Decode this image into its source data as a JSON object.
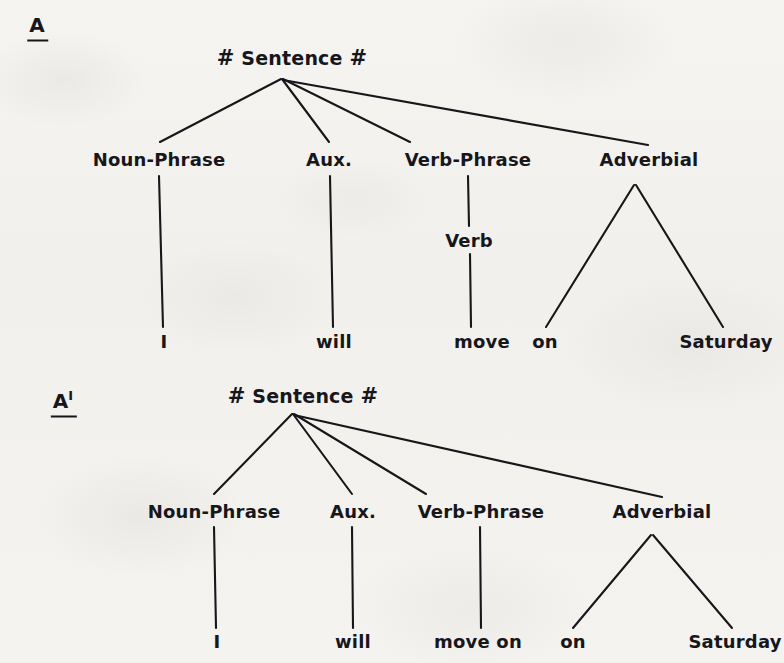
{
  "figure": {
    "kind": "phrase-structure-tree-pair",
    "background_color": "#f3f2ef",
    "ink_color": "#17171b"
  },
  "trees": [
    {
      "id": "A",
      "tag": "A",
      "tag_prime": "",
      "root": {
        "hash_left": "#",
        "text": "Sentence",
        "hash_right": "#"
      },
      "constituents": [
        {
          "label": "Noun-Phrase"
        },
        {
          "label": "Aux."
        },
        {
          "label": "Verb-Phrase"
        },
        {
          "label": "Adverbial"
        }
      ],
      "intermediate": [
        {
          "label": "Verb"
        }
      ],
      "terminals": [
        {
          "word": "I"
        },
        {
          "word": "will"
        },
        {
          "word": "move"
        },
        {
          "word": "on"
        },
        {
          "word": "Saturday"
        }
      ]
    },
    {
      "id": "A-prime",
      "tag": "A",
      "tag_prime": "I",
      "root": {
        "hash_left": "#",
        "text": "Sentence",
        "hash_right": "#"
      },
      "constituents": [
        {
          "label": "Noun-Phrase"
        },
        {
          "label": "Aux."
        },
        {
          "label": "Verb-Phrase"
        },
        {
          "label": "Adverbial"
        }
      ],
      "intermediate": [],
      "terminals": [
        {
          "word": "I"
        },
        {
          "word": "will"
        },
        {
          "word": "move on"
        },
        {
          "word": "on"
        },
        {
          "word": "Saturday"
        }
      ]
    }
  ]
}
